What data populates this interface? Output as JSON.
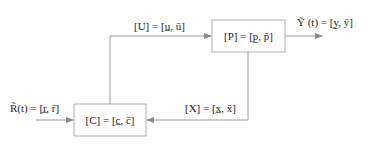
{
  "diagram": {
    "type": "interval feedback control loop",
    "colors": {
      "line": "#9a9a9a",
      "box_border": "#b0b0b0",
      "text": "#222222",
      "background": "#ffffff"
    },
    "blocks": {
      "plant": {
        "label": "[P] = [p̲, p̄]"
      },
      "controller": {
        "label": "[C] = [c̲, c̄]"
      }
    },
    "signals": {
      "control": {
        "label": "[U] = [u̲, ū]"
      },
      "output": {
        "label": "Ỹ (t) = [y̲, ȳ]"
      },
      "reference": {
        "label": "R̃(t) = [r̲, r̄]"
      },
      "state": {
        "label": "[X] = [x̲, x̄]"
      }
    }
  }
}
